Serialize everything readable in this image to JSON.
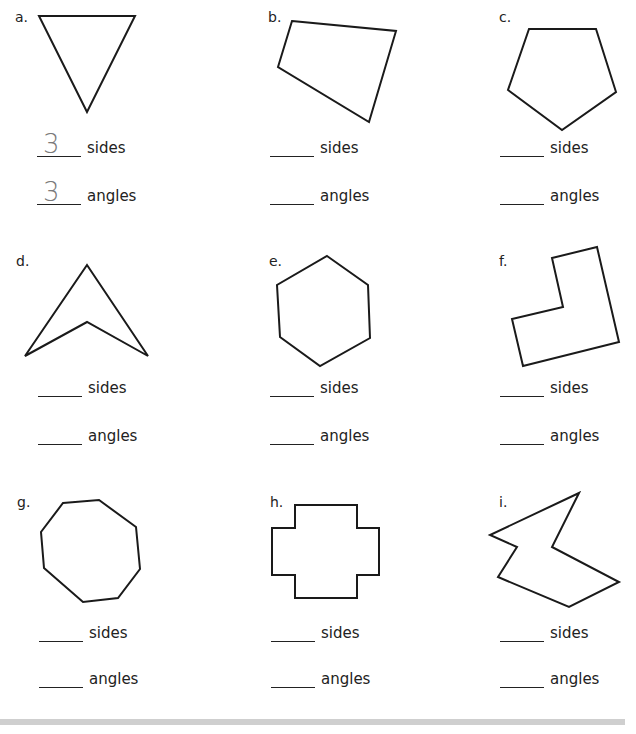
{
  "worksheet": {
    "problems": [
      {
        "letter": "a.",
        "shape": "triangle",
        "sides_label": "sides",
        "angles_label": "angles",
        "sides_answer": "3",
        "angles_answer": "3"
      },
      {
        "letter": "b.",
        "shape": "quadrilateral",
        "sides_label": "sides",
        "angles_label": "angles",
        "sides_answer": "",
        "angles_answer": ""
      },
      {
        "letter": "c.",
        "shape": "pentagon",
        "sides_label": "sides",
        "angles_label": "angles",
        "sides_answer": "",
        "angles_answer": ""
      },
      {
        "letter": "d.",
        "shape": "concave-quadrilateral-arrowhead",
        "sides_label": "sides",
        "angles_label": "angles",
        "sides_answer": "",
        "angles_answer": ""
      },
      {
        "letter": "e.",
        "shape": "hexagon",
        "sides_label": "sides",
        "angles_label": "angles",
        "sides_answer": "",
        "angles_answer": ""
      },
      {
        "letter": "f.",
        "shape": "l-shaped-hexagon",
        "sides_label": "sides",
        "angles_label": "angles",
        "sides_answer": "",
        "angles_answer": ""
      },
      {
        "letter": "g.",
        "shape": "octagon",
        "sides_label": "sides",
        "angles_label": "angles",
        "sides_answer": "",
        "angles_answer": ""
      },
      {
        "letter": "h.",
        "shape": "cross-dodecagon",
        "sides_label": "sides",
        "angles_label": "angles",
        "sides_answer": "",
        "angles_answer": ""
      },
      {
        "letter": "i.",
        "shape": "irregular-heptagon",
        "sides_label": "sides",
        "angles_label": "angles",
        "sides_answer": "",
        "angles_answer": ""
      }
    ]
  }
}
